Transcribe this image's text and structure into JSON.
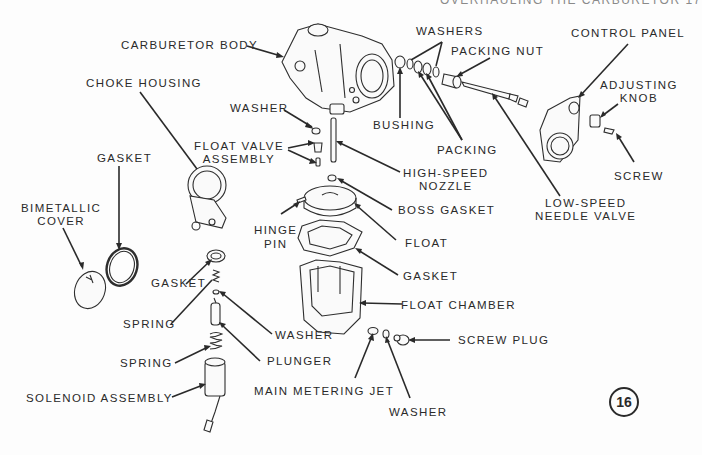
{
  "page": {
    "running_head": "OVERHAULING THE CARBURETOR     17",
    "figure_number": "16"
  },
  "labels": {
    "carburetor_body": "CARBURETOR BODY",
    "choke_housing": "CHOKE HOUSING",
    "washer_top": "WASHER",
    "float_valve_assembly_1": "FLOAT VALVE",
    "float_valve_assembly_2": "ASSEMBLY",
    "gasket_choke": "GASKET",
    "bimetallic_cover_1": "BIMETALLIC",
    "bimetallic_cover_2": "COVER",
    "washers": "WASHERS",
    "packing_nut": "PACKING NUT",
    "bushing": "BUSHING",
    "packing": "PACKING",
    "control_panel": "CONTROL PANEL",
    "adjusting_knob_1": "ADJUSTING",
    "adjusting_knob_2": "KNOB",
    "screw": "SCREW",
    "low_speed_needle_valve_1": "LOW-SPEED",
    "low_speed_needle_valve_2": "NEEDLE VALVE",
    "high_speed_nozzle_1": "HIGH-SPEED",
    "high_speed_nozzle_2": "NOZZLE",
    "boss_gasket": "BOSS GASKET",
    "hinge_pin_1": "HINGE",
    "hinge_pin_2": "PIN",
    "float": "FLOAT",
    "gasket_float": "GASKET",
    "float_chamber": "FLOAT CHAMBER",
    "gasket_solenoid": "GASKET",
    "spring_upper": "SPRING",
    "washer_solenoid": "WASHER",
    "spring_lower": "SPRING",
    "plunger": "PLUNGER",
    "solenoid_assembly": "SOLENOID ASSEMBLY",
    "screw_plug": "SCREW PLUG",
    "main_metering_jet": "MAIN METERING JET",
    "washer_jet": "WASHER"
  },
  "colors": {
    "ink": "#2a2a2a",
    "paper": "#fdfdfd"
  }
}
